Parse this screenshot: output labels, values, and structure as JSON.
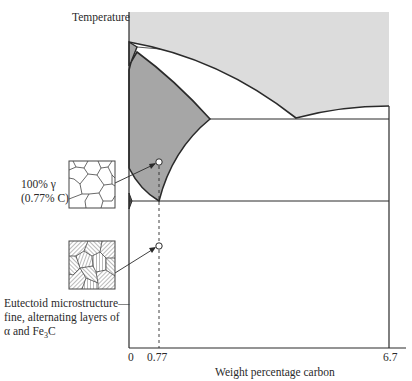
{
  "diagram": {
    "type": "iron-carbon phase diagram (eutectoid cooling)",
    "y_axis_label": "Temperature",
    "x_axis_label": "Weight percentage carbon",
    "x_ticks": [
      "0",
      "0.77",
      "6.7"
    ],
    "annotations": {
      "upper": {
        "line1": "100% γ",
        "line2": "(0.77% C)"
      },
      "lower": {
        "line1": "Eutectoid microstructure—",
        "line2": "fine, alternating layers of",
        "line3_prefix": "α and Fe",
        "line3_sub": "3",
        "line3_suffix": "C"
      }
    },
    "colors": {
      "liquid_region": "#dcdcdc",
      "austenite_region": "#a6a6a6",
      "lines": "#2a2a2a",
      "background": "#ffffff"
    }
  }
}
